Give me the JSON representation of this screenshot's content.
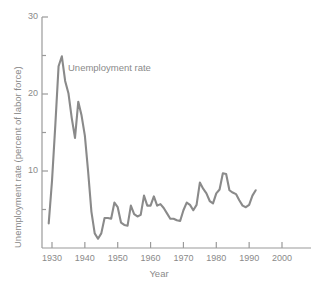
{
  "chart_data": {
    "type": "line",
    "title": "",
    "subtitle": "",
    "xlabel": "Year",
    "ylabel": "Unemployment rate (percent of labor force)",
    "xlim": [
      1925,
      2002
    ],
    "ylim": [
      0,
      30
    ],
    "xticks": [
      1930,
      1940,
      1950,
      1960,
      1970,
      1980,
      1990,
      2000
    ],
    "xtick_labels": [
      "1930",
      "1940",
      "1950",
      "1960",
      "1970",
      "1980",
      "1990",
      "2000"
    ],
    "yticks": [
      10,
      20,
      30
    ],
    "ytick_labels": [
      "10",
      "20",
      "30"
    ],
    "y_minor_ticks": [
      5,
      15,
      25
    ],
    "grid": false,
    "legend_position": "inline-annotation",
    "annotations": [
      {
        "text": "Unemployment rate",
        "x": 1936,
        "y": 22
      }
    ],
    "series": [
      {
        "name": "Unemployment rate",
        "color": "#8a8a8a",
        "x": [
          1929,
          1930,
          1931,
          1932,
          1933,
          1934,
          1935,
          1936,
          1937,
          1938,
          1939,
          1940,
          1941,
          1942,
          1943,
          1944,
          1945,
          1946,
          1947,
          1948,
          1949,
          1950,
          1951,
          1952,
          1953,
          1954,
          1955,
          1956,
          1957,
          1958,
          1959,
          1960,
          1961,
          1962,
          1963,
          1964,
          1965,
          1966,
          1967,
          1968,
          1969,
          1970,
          1971,
          1972,
          1973,
          1974,
          1975,
          1976,
          1977,
          1978,
          1979,
          1980,
          1981,
          1982,
          1983,
          1984,
          1985,
          1986,
          1987,
          1988,
          1989,
          1990,
          1991,
          1992
        ],
        "values": [
          3.2,
          8.7,
          15.9,
          23.6,
          24.9,
          21.7,
          20.1,
          16.9,
          14.3,
          19.0,
          17.2,
          14.6,
          9.9,
          4.7,
          1.9,
          1.2,
          1.9,
          3.9,
          3.9,
          3.8,
          5.9,
          5.3,
          3.3,
          3.0,
          2.9,
          5.5,
          4.4,
          4.1,
          4.3,
          6.8,
          5.5,
          5.5,
          6.7,
          5.5,
          5.7,
          5.2,
          4.5,
          3.8,
          3.8,
          3.6,
          3.5,
          4.9,
          5.9,
          5.6,
          4.9,
          5.6,
          8.5,
          7.7,
          7.1,
          6.1,
          5.8,
          7.1,
          7.6,
          9.7,
          9.6,
          7.5,
          7.2,
          7.0,
          6.2,
          5.5,
          5.3,
          5.6,
          6.8,
          7.5
        ]
      }
    ]
  },
  "axis": {
    "x_title": "Year",
    "y_title": "Unemployment rate (percent of labor force)"
  },
  "style": {
    "line_color": "#8a8a8a",
    "axis_color": "#9a9a9a",
    "text_color": "#8a8a8a",
    "background": "#ffffff"
  }
}
